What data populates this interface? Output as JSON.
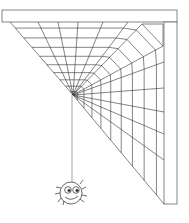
{
  "illustration": {
    "title": "Spider hanging from corner web",
    "colors": {
      "stroke": "#555555",
      "background": "#ffffff",
      "frame_fill": "#ffffff"
    },
    "frame": {
      "top_bar": [
        2,
        10,
        177,
        22
      ],
      "right_post": [
        164,
        10,
        177,
        204
      ]
    },
    "web": {
      "hub": [
        73,
        95
      ],
      "rings": 9
    },
    "spider": {
      "center": [
        70,
        195
      ],
      "thread_x": 72
    }
  }
}
